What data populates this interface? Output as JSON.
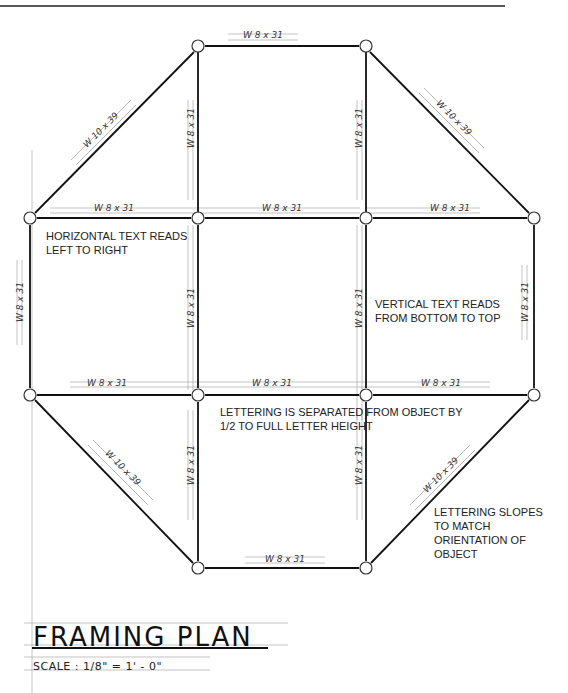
{
  "page": {
    "title": "FRAMING PLAN",
    "scale_label": "SCALE : 1/8\" = 1' - 0\""
  },
  "annotations": {
    "horizontal_text": [
      "HORIZONTAL TEXT READS",
      "LEFT TO RIGHT"
    ],
    "vertical_text": [
      "VERTICAL TEXT READS",
      "FROM BOTTOM TO TOP"
    ],
    "separation": [
      "LETTERING IS SEPARATED FROM OBJECT BY",
      "1/2 TO FULL LETTER HEIGHT"
    ],
    "slope": [
      "LETTERING SLOPES",
      "TO MATCH",
      "ORIENTATION OF",
      "OBJECT"
    ]
  },
  "members": {
    "top": "W 8 x 31",
    "diag_tl": "W 10 x 39",
    "diag_tr": "W 10 x 39",
    "vert_top_left": "W 8 x 31",
    "vert_top_right": "W 8 x 31",
    "row1_left": "W 8 x 31",
    "row1_mid": "W 8 x 31",
    "row1_right": "W 8 x 31",
    "vert_outer_left": "W 8 x 31",
    "vert_mid_left": "W 8 x 31",
    "vert_mid_right": "W 8 x 31",
    "vert_outer_right": "W 8 x 31",
    "row2_left": "W 8 x 31",
    "row2_mid": "W 8 x 31",
    "row2_right": "W 8 x 31",
    "diag_bl": "W 10 x 39",
    "diag_br": "W 10 x 39",
    "vert_bot_left": "W 8 x 31",
    "vert_bot_right": "W 8 x 31",
    "bottom": "W 8 x 31"
  }
}
